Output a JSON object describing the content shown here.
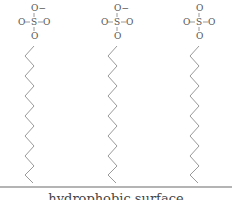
{
  "diagram": {
    "surface_label": "hydrophobic surface",
    "stroke_color": "#9a9a9a",
    "surface_color": "#6a6a6a",
    "molecules": [
      {
        "headgroup": {
          "top": "O−",
          "left": "O",
          "center": "S",
          "right": "O",
          "bottom": "O"
        },
        "x": 34
      },
      {
        "headgroup": {
          "top": "O−",
          "left": "O",
          "center": "S",
          "right": "O",
          "bottom": "O"
        },
        "x": 117
      },
      {
        "headgroup": {
          "top": "O",
          "left": "O",
          "center": "S",
          "right": "O",
          "bottom": "O"
        },
        "x": 199
      }
    ]
  }
}
